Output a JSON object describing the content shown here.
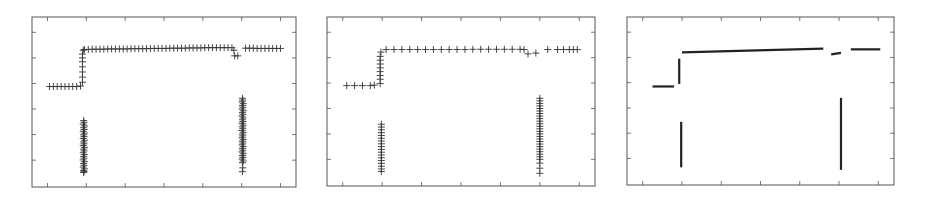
{
  "chart_data": [
    {
      "type": "scatter",
      "marker": "plus",
      "title": "",
      "xlabel": "",
      "ylabel": "",
      "xlim": [
        -0.4,
        6.4
      ],
      "ylim": [
        -0.05,
        6.6
      ],
      "xticks": [
        0,
        1,
        2,
        3,
        4,
        5,
        6
      ],
      "yticks": [
        1,
        2,
        3,
        4,
        5,
        6
      ],
      "tick_labels_visible": false,
      "grid": false,
      "legend": null,
      "frame": {
        "left": 32,
        "top": 17,
        "right": 296,
        "bottom": 187
      },
      "series": [
        {
          "name": "low-step",
          "x": [
            0.05,
            0.15,
            0.25,
            0.35,
            0.45,
            0.55,
            0.65,
            0.75,
            0.85
          ],
          "y": [
            3.88,
            3.88,
            3.88,
            3.88,
            3.88,
            3.88,
            3.88,
            3.88,
            3.9
          ]
        },
        {
          "name": "rise",
          "x": [
            0.9,
            0.9,
            0.9,
            0.9,
            0.9,
            0.9,
            0.9,
            0.92
          ],
          "y": [
            4.05,
            4.25,
            4.45,
            4.65,
            4.85,
            5.0,
            5.15,
            5.3
          ]
        },
        {
          "name": "high-line",
          "x": [
            0.95,
            1.05,
            1.15,
            1.25,
            1.35,
            1.45,
            1.55,
            1.65,
            1.75,
            1.85,
            1.95,
            2.05,
            2.15,
            2.25,
            2.35,
            2.45,
            2.55,
            2.65,
            2.75,
            2.85,
            2.95,
            3.05,
            3.15,
            3.25,
            3.35,
            3.45,
            3.55,
            3.65,
            3.75,
            3.85,
            3.95,
            4.05,
            4.15,
            4.25,
            4.35,
            4.45,
            4.55,
            4.65,
            4.75
          ],
          "y": [
            5.33,
            5.33,
            5.34,
            5.34,
            5.34,
            5.34,
            5.35,
            5.35,
            5.35,
            5.35,
            5.35,
            5.35,
            5.36,
            5.36,
            5.36,
            5.36,
            5.36,
            5.37,
            5.37,
            5.37,
            5.37,
            5.37,
            5.38,
            5.38,
            5.38,
            5.38,
            5.38,
            5.39,
            5.39,
            5.39,
            5.39,
            5.4,
            5.4,
            5.4,
            5.4,
            5.4,
            5.4,
            5.4,
            5.4
          ]
        },
        {
          "name": "dip",
          "x": [
            4.8,
            4.82,
            4.9
          ],
          "y": [
            5.3,
            5.08,
            5.08
          ]
        },
        {
          "name": "high-line-right",
          "x": [
            5.1,
            5.2,
            5.3,
            5.4,
            5.5,
            5.6,
            5.7,
            5.8,
            5.9,
            6.0
          ],
          "y": [
            5.38,
            5.38,
            5.38,
            5.37,
            5.37,
            5.37,
            5.37,
            5.37,
            5.37,
            5.37
          ]
        },
        {
          "name": "vertical-cluster-1",
          "x": [
            0.93,
            0.94,
            0.92,
            0.95,
            0.93,
            0.94,
            0.92,
            0.95,
            0.93,
            0.94,
            0.92,
            0.95,
            0.93,
            0.94,
            0.92,
            0.95,
            0.93,
            0.94,
            0.92,
            0.95,
            0.93,
            0.94,
            0.92,
            0.95,
            0.93,
            0.94,
            0.92,
            0.95,
            0.93,
            0.94,
            0.93
          ],
          "y": [
            2.55,
            2.48,
            2.41,
            2.34,
            2.27,
            2.2,
            2.13,
            2.06,
            1.99,
            1.92,
            1.85,
            1.78,
            1.71,
            1.64,
            1.57,
            1.5,
            1.43,
            1.36,
            1.29,
            1.22,
            1.15,
            1.08,
            1.01,
            0.94,
            0.87,
            0.8,
            0.73,
            0.66,
            0.6,
            0.55,
            0.52
          ]
        },
        {
          "name": "vertical-cluster-2",
          "x": [
            5.02,
            5.03,
            5.01,
            5.04,
            5.02,
            5.03,
            5.01,
            5.04,
            5.02,
            5.03,
            5.01,
            5.04,
            5.02,
            5.03,
            5.01,
            5.04,
            5.02,
            5.03,
            5.01,
            5.04,
            5.02,
            5.03,
            5.01,
            5.04,
            5.02,
            5.03,
            5.01,
            5.04,
            5.02,
            5.03,
            5.01,
            5.04,
            5.02,
            5.03,
            5.01,
            5.04,
            5.02,
            5.03,
            5.02
          ],
          "y": [
            3.42,
            3.35,
            3.28,
            3.21,
            3.14,
            3.07,
            3.0,
            2.93,
            2.86,
            2.79,
            2.72,
            2.65,
            2.58,
            2.51,
            2.44,
            2.37,
            2.3,
            2.23,
            2.16,
            2.09,
            2.02,
            1.95,
            1.88,
            1.81,
            1.74,
            1.67,
            1.6,
            1.53,
            1.46,
            1.39,
            1.32,
            1.25,
            1.18,
            1.11,
            1.04,
            0.97,
            0.9,
            0.7,
            0.55
          ]
        }
      ]
    },
    {
      "type": "scatter",
      "marker": "plus",
      "title": "",
      "xlabel": "",
      "ylabel": "",
      "xlim": [
        -0.4,
        6.4
      ],
      "ylim": [
        -0.05,
        6.6
      ],
      "xticks": [
        0,
        1,
        2,
        3,
        4,
        5,
        6
      ],
      "yticks": [
        1,
        2,
        3,
        4,
        5,
        6
      ],
      "tick_labels_visible": false,
      "grid": false,
      "legend": null,
      "frame": {
        "left": 327,
        "top": 17,
        "right": 595,
        "bottom": 186
      },
      "series": [
        {
          "name": "low-step",
          "x": [
            0.1,
            0.3,
            0.5,
            0.7,
            0.8
          ],
          "y": [
            3.9,
            3.9,
            3.9,
            3.9,
            3.92
          ]
        },
        {
          "name": "rise",
          "x": [
            0.95,
            0.95,
            0.95,
            0.95,
            0.95,
            0.95,
            0.95,
            0.95
          ],
          "y": [
            3.98,
            4.15,
            4.3,
            4.45,
            4.6,
            4.75,
            4.9,
            5.05
          ]
        },
        {
          "name": "high-line",
          "x": [
            0.97,
            1.1,
            1.3,
            1.5,
            1.7,
            1.9,
            2.1,
            2.3,
            2.5,
            2.7,
            2.9,
            3.1,
            3.3,
            3.5,
            3.7,
            3.9,
            4.1,
            4.3,
            4.5,
            4.6
          ],
          "y": [
            5.22,
            5.32,
            5.32,
            5.32,
            5.32,
            5.32,
            5.32,
            5.32,
            5.32,
            5.32,
            5.32,
            5.32,
            5.33,
            5.33,
            5.33,
            5.33,
            5.33,
            5.33,
            5.33,
            5.32
          ]
        },
        {
          "name": "dip",
          "x": [
            4.7,
            4.9
          ],
          "y": [
            5.15,
            5.18
          ]
        },
        {
          "name": "high-line-right",
          "x": [
            5.2,
            5.45,
            5.6,
            5.75,
            5.85,
            5.95
          ],
          "y": [
            5.32,
            5.32,
            5.32,
            5.32,
            5.32,
            5.32
          ]
        },
        {
          "name": "vertical-cluster-1",
          "x": [
            0.98,
            0.98,
            0.98,
            0.98,
            0.98,
            0.98,
            0.98,
            0.98,
            0.98,
            0.98,
            0.98,
            0.98,
            0.98,
            0.98,
            0.98,
            0.98,
            0.98,
            0.98
          ],
          "y": [
            2.38,
            2.27,
            2.16,
            2.05,
            1.94,
            1.83,
            1.72,
            1.61,
            1.5,
            1.39,
            1.28,
            1.17,
            1.06,
            0.95,
            0.84,
            0.73,
            0.62,
            0.52
          ]
        },
        {
          "name": "vertical-cluster-2",
          "x": [
            5.0,
            5.0,
            5.0,
            5.0,
            5.0,
            5.0,
            5.0,
            5.0,
            5.0,
            5.0,
            5.0,
            5.0,
            5.0,
            5.0,
            5.0,
            5.0,
            5.0,
            5.0,
            5.0,
            5.0,
            5.0,
            5.0,
            5.0,
            5.0,
            5.0,
            5.0,
            5.0,
            5.0
          ],
          "y": [
            3.4,
            3.3,
            3.2,
            3.1,
            3.0,
            2.9,
            2.8,
            2.7,
            2.6,
            2.5,
            2.4,
            2.3,
            2.2,
            2.1,
            2.0,
            1.9,
            1.8,
            1.7,
            1.6,
            1.5,
            1.4,
            1.3,
            1.2,
            1.1,
            1.0,
            0.85,
            0.65,
            0.45
          ]
        }
      ]
    },
    {
      "type": "line",
      "marker": "none",
      "title": "",
      "xlabel": "",
      "ylabel": "",
      "xlim": [
        -0.4,
        6.4
      ],
      "ylim": [
        -0.05,
        6.6
      ],
      "xticks": [
        0,
        1,
        2,
        3,
        4,
        5,
        6
      ],
      "yticks": [
        1,
        2,
        3,
        4,
        5,
        6
      ],
      "tick_labels_visible": false,
      "grid": false,
      "legend": null,
      "frame": {
        "left": 627,
        "top": 17,
        "right": 894,
        "bottom": 185
      },
      "series": [
        {
          "name": "low-step",
          "x": [
            0.25,
            0.8
          ],
          "y": [
            3.85,
            3.85
          ]
        },
        {
          "name": "rise",
          "x": [
            0.93,
            0.93
          ],
          "y": [
            3.95,
            4.95
          ]
        },
        {
          "name": "high-line",
          "x": [
            1.0,
            4.6
          ],
          "y": [
            5.2,
            5.35
          ]
        },
        {
          "name": "dip",
          "x": [
            4.8,
            5.05
          ],
          "y": [
            5.12,
            5.18
          ]
        },
        {
          "name": "high-line-right",
          "x": [
            5.3,
            6.05
          ],
          "y": [
            5.32,
            5.32
          ]
        },
        {
          "name": "vertical-cluster-1",
          "x": [
            0.98,
            0.98
          ],
          "y": [
            2.45,
            0.65
          ]
        },
        {
          "name": "vertical-cluster-2",
          "x": [
            5.05,
            5.05
          ],
          "y": [
            3.4,
            0.55
          ]
        }
      ]
    }
  ],
  "panels": [
    {
      "id": "panel-1",
      "label": "crosses, dense"
    },
    {
      "id": "panel-2",
      "label": "crosses, sparse"
    },
    {
      "id": "panel-3",
      "label": "line segments"
    }
  ],
  "colors": {
    "axis": "#555555",
    "marker": "#333333",
    "line": "#222222",
    "background": "#ffffff"
  }
}
